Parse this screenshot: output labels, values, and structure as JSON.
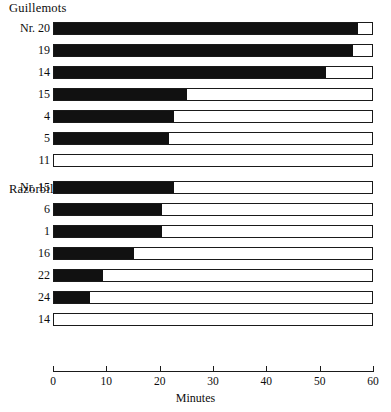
{
  "chart_data": {
    "type": "bar",
    "orientation": "horizontal",
    "title": "",
    "xlabel": "Minutes",
    "ylabel": "",
    "xlim": [
      0,
      60
    ],
    "xticks": [
      0,
      10,
      20,
      30,
      40,
      50,
      60
    ],
    "xtick_labels": [
      "0",
      "10",
      "20",
      "30",
      "40",
      "50",
      "60"
    ],
    "grid": false,
    "legend": "none",
    "total_length": 60,
    "colors": {
      "filled": "#111111",
      "empty": "#ffffff",
      "outline": "#1a1a1a"
    },
    "groups": [
      {
        "name": "Guillemots",
        "label_prefix": "Nr.",
        "categories": [
          "Nr. 20",
          "19",
          "14",
          "15",
          "4",
          "5",
          "11"
        ],
        "values": [
          57,
          56,
          51,
          25,
          22.5,
          21.5,
          0
        ],
        "series": [
          {
            "name": "filled",
            "values": [
              57,
              56,
              51,
              25,
              22.5,
              21.5,
              0
            ]
          },
          {
            "name": "remainder",
            "values": [
              3,
              4,
              9,
              35,
              37.5,
              38.5,
              60
            ]
          }
        ]
      },
      {
        "name": "Razorbills",
        "label_prefix": "Nr.",
        "categories": [
          "Nr. 15",
          "6",
          "1",
          "16",
          "22",
          "24",
          "14"
        ],
        "values": [
          22.5,
          20.3,
          20.3,
          15,
          9.2,
          6.8,
          0
        ],
        "series": [
          {
            "name": "filled",
            "values": [
              22.5,
              20.3,
              20.3,
              15,
              9.2,
              6.8,
              0
            ]
          },
          {
            "name": "remainder",
            "values": [
              37.5,
              39.7,
              39.7,
              45,
              50.8,
              53.2,
              60
            ]
          }
        ]
      }
    ]
  },
  "axis": {
    "title": "Minutes"
  }
}
